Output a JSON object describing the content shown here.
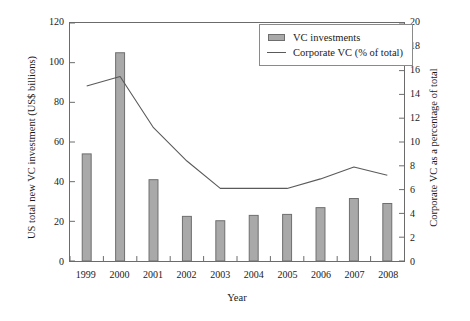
{
  "chart_data": {
    "type": "bar",
    "title": "",
    "subtitle": "",
    "xlabel": "Year",
    "ylabel": "US total new VC investment (US$ billions)",
    "y2label": "Corporate VC as a percentage of total",
    "categories": [
      "1999",
      "2000",
      "2001",
      "2002",
      "2003",
      "2004",
      "2005",
      "2006",
      "2007",
      "2008"
    ],
    "ylim": [
      0,
      120
    ],
    "y2lim": [
      0,
      20
    ],
    "yticks": [
      0,
      20,
      40,
      60,
      80,
      100,
      120
    ],
    "y2ticks": [
      0,
      2,
      4,
      6,
      8,
      10,
      12,
      14,
      16,
      18,
      20
    ],
    "grid": false,
    "legend_position": "top-center",
    "series": [
      {
        "name": "VC investments",
        "type": "bar",
        "axis": "left",
        "unit": "US$ billions",
        "color": "#a9a9a9",
        "edge_color": "#6e6e6e",
        "values": [
          54,
          105,
          41,
          22.5,
          20.3,
          23,
          23.5,
          26.9,
          31.5,
          29
        ]
      },
      {
        "name": "Corporate VC (% of total)",
        "type": "line",
        "axis": "right",
        "unit": "% of total",
        "color": "#5a5a5a",
        "values": [
          14.7,
          15.5,
          11.2,
          8.4,
          6.1,
          6.1,
          6.1,
          6.9,
          7.9,
          7.2
        ]
      }
    ]
  },
  "axes": {
    "left": {
      "title": "US total new VC investment (US$ billions)",
      "tick_labels": [
        "0",
        "20",
        "40",
        "60",
        "80",
        "100",
        "120"
      ]
    },
    "right": {
      "title": "Corporate VC as a percentage of total",
      "tick_labels": [
        "0",
        "2",
        "4",
        "6",
        "8",
        "10",
        "12",
        "14",
        "16",
        "18",
        "20"
      ]
    },
    "bottom": {
      "title": "Year",
      "tick_labels": [
        "1999",
        "2000",
        "2001",
        "2002",
        "2003",
        "2004",
        "2005",
        "2006",
        "2007",
        "2008"
      ]
    }
  },
  "legend": {
    "items": [
      {
        "label": "VC investments",
        "glyph": "bar-swatch"
      },
      {
        "label": "Corporate VC (% of total)",
        "glyph": "line-swatch"
      }
    ]
  },
  "colors": {
    "bar_fill": "#a9a9a9",
    "bar_edge": "#6e6e6e",
    "line": "#5a5a5a",
    "axis": "#6b6b6b",
    "text": "#1a1a1a",
    "background": "#ffffff"
  }
}
